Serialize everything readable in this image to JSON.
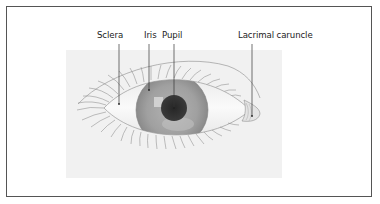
{
  "diagram": {
    "labels": [
      {
        "id": "sclera",
        "text": "Sclera"
      },
      {
        "id": "iris",
        "text": "Iris"
      },
      {
        "id": "pupil",
        "text": "Pupil"
      },
      {
        "id": "lacrimal_caruncle",
        "text": "Lacrimal caruncle"
      }
    ],
    "colors": {
      "frame": "#555555",
      "panel": "#f1f1f1",
      "sclera": "#f8f8f8",
      "iris": "#9a9a9a",
      "pupil": "#2f2f2f",
      "leader_line": "#333333",
      "lashes": "#8c8c8c"
    }
  }
}
